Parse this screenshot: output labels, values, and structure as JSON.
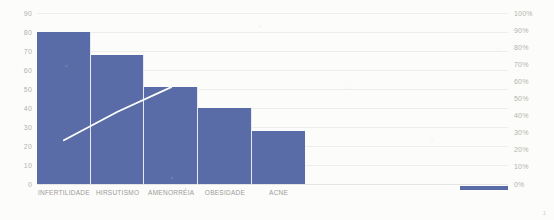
{
  "chart_data": {
    "type": "bar",
    "title": "",
    "subtitle": "",
    "xlabel": "",
    "ylabel": "",
    "categories": [
      "INFERTILIDADE",
      "HIRSUTISMO",
      "AMENORRÉIA",
      "OBESIDADE",
      "ACNE"
    ],
    "series": [
      {
        "name": "Frequência",
        "type": "bar",
        "values": [
          80,
          68,
          51,
          40,
          28
        ],
        "color": "#5a6ca8",
        "axis": "left"
      },
      {
        "name": "Percentual acumulado",
        "type": "line",
        "values": [
          23,
          38,
          51,
          null,
          null
        ],
        "color": "#ffffff",
        "axis": "left"
      }
    ],
    "ylim": [
      0,
      90
    ],
    "yticks": [
      0,
      10,
      20,
      30,
      40,
      50,
      60,
      70,
      80,
      90
    ],
    "ytick_labels": [
      "0",
      "10",
      "20",
      "30",
      "40",
      "50",
      "60",
      "70",
      "80",
      "90"
    ],
    "y2lim": [
      0,
      100
    ],
    "y2ticks": [
      0,
      10,
      20,
      30,
      40,
      50,
      60,
      70,
      80,
      90,
      100
    ],
    "y2tick_labels": [
      "0%",
      "10%",
      "20%",
      "30%",
      "40%",
      "50%",
      "60%",
      "70%",
      "80%",
      "90%",
      "100%"
    ],
    "grid": true,
    "grid_axis": "y",
    "legend": "none",
    "bar_gap": 0,
    "plot_fill_fraction": 0.57
  },
  "axes": {
    "left": {
      "name": "primary-value-axis",
      "ticks": [
        "90",
        "80",
        "70",
        "60",
        "50",
        "40",
        "30",
        "20",
        "10",
        "0"
      ]
    },
    "right": {
      "name": "secondary-percent-axis",
      "ticks": [
        "100%",
        "90%",
        "80%",
        "70%",
        "60%",
        "50%",
        "40%",
        "30%",
        "20%",
        "10%",
        "0%"
      ]
    }
  },
  "categories": [
    "INFERTILIDADE",
    "HIRSUTISMO",
    "AMENORRÉIA",
    "OBESIDADE",
    "ACNE"
  ],
  "footer": {
    "page_number": "1"
  },
  "colors": {
    "bar": "#5a6ca8",
    "line": "#ffffff",
    "grid": "#ededec",
    "axis_text": "#b4b3ae",
    "category_text": "#9c9b97",
    "background": "#fcfcfb"
  }
}
